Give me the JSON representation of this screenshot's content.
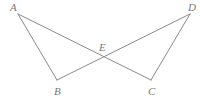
{
  "figure": {
    "kind": "geometry-diagram",
    "background_color": "#ffffff",
    "stroke_color": "#8a8a8a",
    "label_color": "#7a7a7a",
    "stroke_width": 1,
    "width": 207,
    "height": 100,
    "points": [
      {
        "name": "A",
        "label": "A",
        "x": 18,
        "y": 14,
        "label_x": 10,
        "label_y": 2
      },
      {
        "name": "B",
        "label": "B",
        "x": 57,
        "y": 80,
        "label_x": 54,
        "label_y": 86
      },
      {
        "name": "C",
        "label": "C",
        "x": 151,
        "y": 80,
        "label_x": 148,
        "label_y": 86
      },
      {
        "name": "D",
        "label": "D",
        "x": 190,
        "y": 14,
        "label_x": 188,
        "label_y": 2
      },
      {
        "name": "E",
        "label": "E",
        "x": 104,
        "y": 58,
        "label_x": 99,
        "label_y": 42
      }
    ],
    "segments": [
      {
        "name": "segment-AB",
        "from": "A",
        "to": "B",
        "x1": 18,
        "y1": 14,
        "x2": 57,
        "y2": 80
      },
      {
        "name": "segment-AC",
        "from": "A",
        "to": "C",
        "x1": 18,
        "y1": 14,
        "x2": 151,
        "y2": 80
      },
      {
        "name": "segment-DC",
        "from": "D",
        "to": "C",
        "x1": 190,
        "y1": 14,
        "x2": 151,
        "y2": 80
      },
      {
        "name": "segment-DB",
        "from": "D",
        "to": "B",
        "x1": 190,
        "y1": 14,
        "x2": 57,
        "y2": 80
      }
    ]
  }
}
